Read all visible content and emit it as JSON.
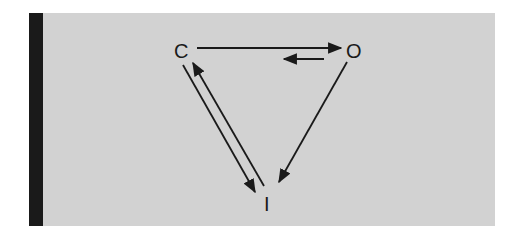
{
  "diagram": {
    "nodes": [
      {
        "id": "C",
        "label": "C"
      },
      {
        "id": "O",
        "label": "O"
      },
      {
        "id": "I",
        "label": "I"
      }
    ],
    "edges": [
      {
        "from": "C",
        "to": "O",
        "label": ""
      },
      {
        "from": "O",
        "to": "C",
        "label": "",
        "style": "short"
      },
      {
        "from": "C",
        "to": "I",
        "label": ""
      },
      {
        "from": "I",
        "to": "C",
        "label": ""
      },
      {
        "from": "O",
        "to": "I",
        "label": ""
      }
    ]
  },
  "colors": {
    "background": "#d2d2d2",
    "sidebar": "#1a1a1a",
    "ink": "#1a1a1a"
  }
}
